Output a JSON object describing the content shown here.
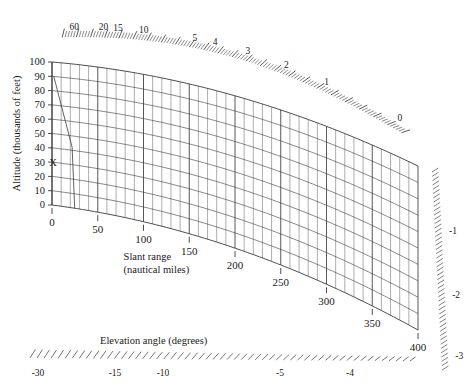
{
  "chart_data": {
    "type": "line",
    "title": "",
    "subtitle": "",
    "xlabel": "Slant range",
    "xlabel_sub": "(nautical miles)",
    "ylabel": "Altitude (thousands of feet)",
    "zlabel": "Elevation angle (degrees)",
    "grid": true,
    "legend": "none",
    "ylim": [
      0,
      100
    ],
    "xlim": [
      0,
      400
    ],
    "y_ticks": [
      0,
      10,
      20,
      30,
      40,
      50,
      60,
      70,
      80,
      90,
      100
    ],
    "y_tick_labels": [
      "0",
      "10",
      "20",
      "30",
      "40",
      "50",
      "60",
      "70",
      "80",
      "90",
      "100"
    ],
    "x_ticks": [
      0,
      50,
      100,
      150,
      200,
      250,
      300,
      350,
      400
    ],
    "x_tick_labels": [
      "0",
      "50",
      "100",
      "150",
      "200",
      "250",
      "300",
      "350",
      "400"
    ],
    "x_minor_step": 10,
    "elevation_labels_top": [
      "60",
      "20",
      "15",
      "10",
      "5",
      "4",
      "3",
      "2",
      "1",
      "0"
    ],
    "elevation_labels_bottom": [
      "-30",
      "-15",
      "-10",
      "-5",
      "-4",
      "-3"
    ],
    "elevation_labels_right": [
      "-1",
      "-2",
      "-3"
    ],
    "elevation_angles_positive": [
      60,
      20,
      15,
      10,
      5,
      4,
      3,
      2,
      1,
      0
    ],
    "elevation_angles_negative": [
      -30,
      -15,
      -10,
      -5,
      -4,
      -3,
      -2,
      -1
    ],
    "marker": {
      "symbol": "X",
      "altitude": 30,
      "slant_range": 0
    },
    "line_color": "#3a3a3a",
    "text_color": "#1a1a1a",
    "background": "#ffffff"
  }
}
